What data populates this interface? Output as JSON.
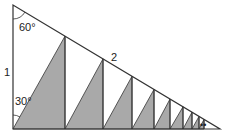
{
  "diagram": {
    "type": "geometry",
    "labels": {
      "top_angle": "60°",
      "bottom_angle": "30°",
      "vertical_side": "1",
      "hypotenuse": "2"
    },
    "colors": {
      "shade": "#a9a9a9",
      "stroke": "#333333",
      "background": "#ffffff"
    },
    "main_triangle": {
      "top": [
        13,
        5
      ],
      "bottom_left": [
        13,
        129
      ],
      "bottom_right": [
        220,
        129
      ]
    },
    "vertical_lines_x": [
      65,
      103,
      132,
      154,
      170,
      183,
      192,
      199,
      204
    ],
    "continuation": "••"
  }
}
